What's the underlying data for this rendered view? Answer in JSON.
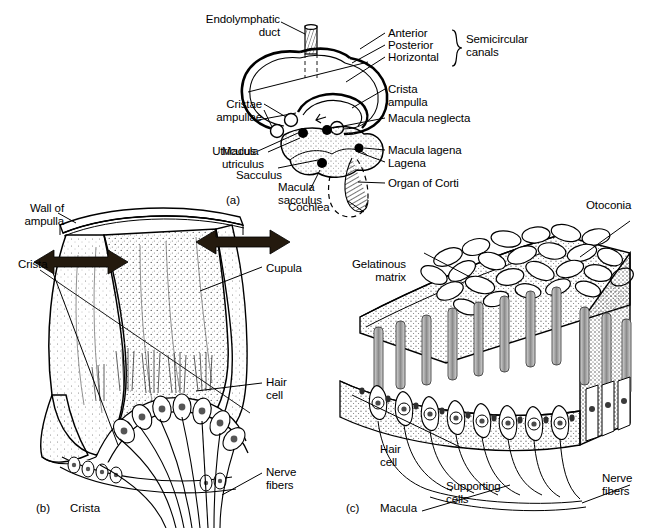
{
  "figure": {
    "background_color": "#ffffff",
    "ink_color": "#000000",
    "width": 662,
    "height": 528
  },
  "panel_a": {
    "letter": "(a)",
    "labels": {
      "endolymphatic_duct": "Endolymphatic\nduct",
      "anterior": "Anterior",
      "posterior": "Posterior",
      "horizontal": "Horizontal",
      "semicircular_canals": "Semicircular\ncanals",
      "crista_ampulla": "Crista\nampulla",
      "cristae_ampullae": "Cristae\nampullae",
      "macula_neglecta": "Macula neglecta",
      "macula_lagena": "Macula lagena",
      "utriculus": "Utriculus",
      "macula_utriculus": "Macula\nutriculus",
      "sacculus": "Sacculus",
      "lagena": "Lagena",
      "macula_sacculus": "Macula\nsacculus",
      "organ_of_corti": "Organ of Corti",
      "cochlea": "Cochlea"
    }
  },
  "panel_b": {
    "letter": "(b)",
    "caption": "Crista",
    "labels": {
      "wall_of_ampulla": "Wall of\nampulla",
      "crista": "Crista",
      "cupula": "Cupula",
      "hair_cell": "Hair\ncell",
      "nerve_fibers": "Nerve\nfibers"
    },
    "arrows": {
      "count": 2,
      "style": "double-headed",
      "meaning": "cupula deflection direction"
    }
  },
  "panel_c": {
    "letter": "(c)",
    "caption": "Macula",
    "labels": {
      "otoconia": "Otoconia",
      "gelatinous_matrix": "Gelatinous\nmatrix",
      "hair_cell": "Hair\ncell",
      "supporting_cells": "Supporting\ncells",
      "nerve_fibers": "Nerve\nfibers"
    }
  }
}
